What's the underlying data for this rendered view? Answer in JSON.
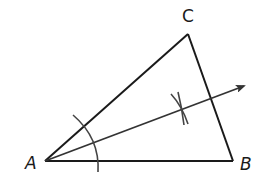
{
  "diagram": {
    "type": "angle-bisector-construction",
    "vertices": {
      "A": {
        "label": "A",
        "x": 45,
        "y": 161,
        "label_x": 25,
        "label_y": 169
      },
      "B": {
        "label": "B",
        "x": 233,
        "y": 161,
        "label_x": 240,
        "label_y": 170
      },
      "C": {
        "label": "C",
        "x": 188,
        "y": 34,
        "label_x": 182,
        "label_y": 22
      }
    },
    "bisector_ray": {
      "from": "A",
      "to_x": 246,
      "to_y": 85
    },
    "colors": {
      "stroke": "#1a1a1a",
      "bisector": "#333333",
      "arc": "#444444",
      "background": "#ffffff"
    }
  }
}
